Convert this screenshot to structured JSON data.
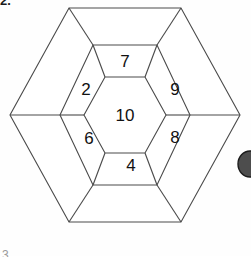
{
  "page": {
    "item_number_top": "2.",
    "item_number_bottom": "3.",
    "background_color": "#fefefe"
  },
  "figure": {
    "name": "nested-hexagon-number-puzzle",
    "line_color": "#4a4a4a",
    "face_color": "#ffffff",
    "number_color": "#111111",
    "cells": [
      {
        "id": "center",
        "ring": "inner",
        "position": "center",
        "value": "10",
        "cx": 125,
        "cy": 115
      },
      {
        "id": "mid-top",
        "ring": "middle",
        "position": "top",
        "value": "7",
        "cx": 125,
        "cy": 60
      },
      {
        "id": "mid-upper-left",
        "ring": "middle",
        "position": "upper-left",
        "value": "2",
        "cx": 85,
        "cy": 89
      },
      {
        "id": "mid-upper-right",
        "ring": "middle",
        "position": "upper-right",
        "value": "9",
        "cx": 174,
        "cy": 89
      },
      {
        "id": "mid-lower-left",
        "ring": "middle",
        "position": "lower-left",
        "value": "6",
        "cx": 88,
        "cy": 137
      },
      {
        "id": "mid-lower-right",
        "ring": "middle",
        "position": "lower-right",
        "value": "8",
        "cx": 174,
        "cy": 136
      },
      {
        "id": "mid-bottom",
        "ring": "middle",
        "position": "bottom",
        "value": "4",
        "cx": 130,
        "cy": 163
      },
      {
        "id": "outer-top",
        "ring": "outer",
        "position": "top",
        "value": "",
        "cx": 125,
        "cy": 25
      },
      {
        "id": "outer-upper-left",
        "ring": "outer",
        "position": "upper-left",
        "value": "",
        "cx": 58,
        "cy": 70
      },
      {
        "id": "outer-upper-right",
        "ring": "outer",
        "position": "upper-right",
        "value": "",
        "cx": 198,
        "cy": 70
      },
      {
        "id": "outer-lower-left",
        "ring": "outer",
        "position": "lower-left",
        "value": "",
        "cx": 58,
        "cy": 162
      },
      {
        "id": "outer-lower-right",
        "ring": "outer",
        "position": "lower-right",
        "value": "",
        "cx": 198,
        "cy": 162
      },
      {
        "id": "outer-bottom",
        "ring": "outer",
        "position": "bottom",
        "value": "",
        "cx": 125,
        "cy": 205
      }
    ],
    "numbers_shown": [
      "10",
      "7",
      "2",
      "9",
      "6",
      "8",
      "4"
    ],
    "geometry": {
      "center_x": 125,
      "center_y": 115,
      "outer_hexagon_points": "125,8 225,8 240,115 225,222 125,222 25,222 10,115 25,8",
      "outer_vertices": [
        {
          "x": 69,
          "y": 8
        },
        {
          "x": 181,
          "y": 8
        },
        {
          "x": 240,
          "y": 115
        },
        {
          "x": 181,
          "y": 222
        },
        {
          "x": 69,
          "y": 222
        },
        {
          "x": 10,
          "y": 115
        }
      ],
      "middle_vertices": [
        {
          "x": 93,
          "y": 45
        },
        {
          "x": 157,
          "y": 45
        },
        {
          "x": 190,
          "y": 115
        },
        {
          "x": 157,
          "y": 185
        },
        {
          "x": 93,
          "y": 185
        },
        {
          "x": 60,
          "y": 115
        }
      ],
      "inner_vertices": [
        {
          "x": 105,
          "y": 77
        },
        {
          "x": 145,
          "y": 77
        },
        {
          "x": 166,
          "y": 115
        },
        {
          "x": 145,
          "y": 153
        },
        {
          "x": 105,
          "y": 153
        },
        {
          "x": 84,
          "y": 115
        }
      ]
    }
  },
  "edge_artifact": {
    "name": "partial-dark-blob",
    "description": "A dark rounded shape clipped by the right edge of the image",
    "color": "#4d4d4d",
    "cx": 249,
    "cy": 164,
    "rx": 12,
    "ry": 13
  }
}
